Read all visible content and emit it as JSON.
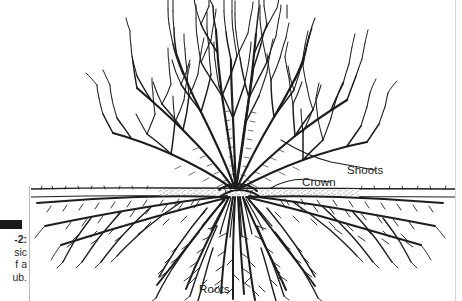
{
  "figure": {
    "caption": {
      "bar": "black-rule",
      "lines": [
        "-2:",
        "sic",
        "f a",
        "ub."
      ],
      "full_text_inferred": "Figure  -2: The basic parts of a shrub."
    },
    "title_alt": "Line drawing of a shrub showing shoots, crown and roots",
    "ground_line_y": 190,
    "labels": {
      "shoots": "Shoots",
      "crown": "Crown",
      "roots": "Roots"
    },
    "colors": {
      "ink": "#1d1d1d",
      "soil": "#555555",
      "paper": "#ffffff",
      "rule": "#b9b9b9"
    }
  }
}
